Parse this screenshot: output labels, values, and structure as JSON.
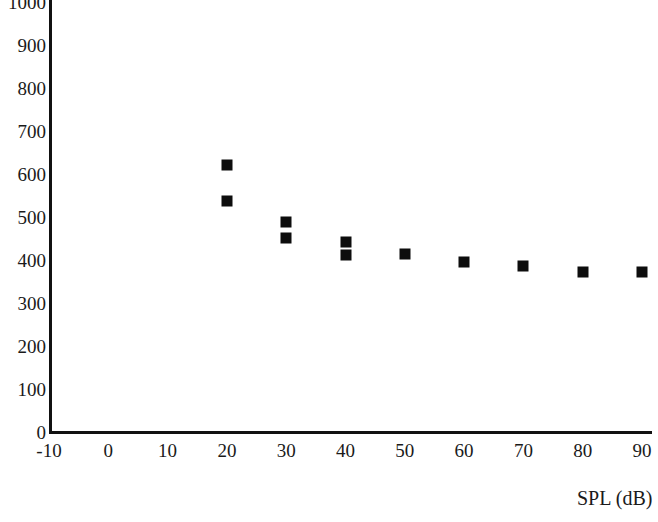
{
  "chart_data": {
    "type": "scatter",
    "title": "",
    "subtitle": "",
    "xlabel": "SPL (dB)",
    "ylabel": "",
    "xlim": [
      -10,
      90
    ],
    "ylim": [
      0,
      1000
    ],
    "xticks": [
      "-10",
      "0",
      "10",
      "20",
      "30",
      "40",
      "50",
      "60",
      "70",
      "80",
      "90"
    ],
    "xtick_values": [
      -10,
      0,
      10,
      20,
      30,
      40,
      50,
      60,
      70,
      80,
      90
    ],
    "yticks": [
      "0",
      "100",
      "200",
      "300",
      "400",
      "500",
      "600",
      "700",
      "800",
      "900",
      "1000"
    ],
    "ytick_values": [
      0,
      100,
      200,
      300,
      400,
      500,
      600,
      700,
      800,
      900,
      1000
    ],
    "grid": false,
    "legend": null,
    "legend_position": "none",
    "marker": "square",
    "marker_color": "#0d0d0d",
    "series": [
      {
        "name": "",
        "points": [
          {
            "x": 20,
            "y": 622
          },
          {
            "x": 20,
            "y": 538
          },
          {
            "x": 30,
            "y": 489
          },
          {
            "x": 30,
            "y": 452
          },
          {
            "x": 40,
            "y": 443
          },
          {
            "x": 40,
            "y": 412
          },
          {
            "x": 50,
            "y": 414
          },
          {
            "x": 60,
            "y": 396
          },
          {
            "x": 70,
            "y": 387
          },
          {
            "x": 80,
            "y": 373
          },
          {
            "x": 90,
            "y": 373
          }
        ]
      }
    ]
  },
  "axis": {
    "line_color": "#111111"
  }
}
